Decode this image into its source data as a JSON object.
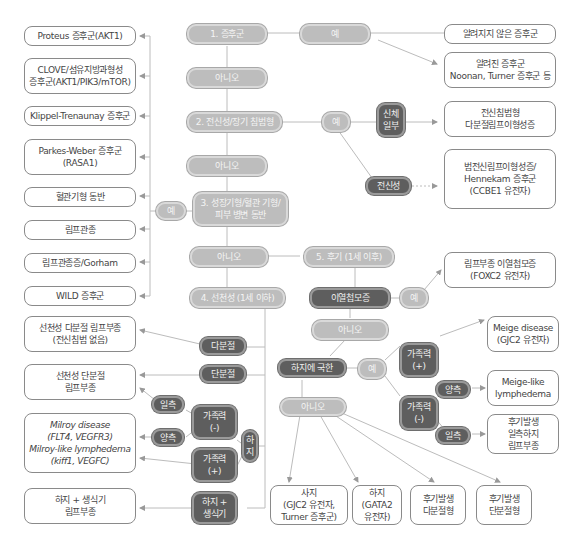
{
  "diagram": {
    "type": "flowchart",
    "colors": {
      "question": "#bdbdbd",
      "decision_dark": "#5e5e5e",
      "outcome_border": "#8a8a8a",
      "line": "#b5b5b5"
    },
    "main_steps": {
      "s1": "1. 증후군",
      "s1_yes": "예",
      "s1_no": "아니오",
      "s2": "2. 전신성/장기 침범형",
      "s2_yes": "예",
      "s2_no": "아니오",
      "s3": "3. 성장기형/혈관 기형/\n피부 병변 동반",
      "s3_yes": "예",
      "s3_no": "아니오",
      "s4": "4. 선천성 (1세 이하)",
      "s5": "5. 후기 (1세 이후)"
    },
    "step1_outcomes": [
      "알려지지 않은 증후군",
      "알려진 증후군\nNoonan, Turner 증후군 등"
    ],
    "step2_branches": {
      "partial": "신체\n일부",
      "partial_outcome": "전신침범형\n다분절림프이형성증",
      "systemic": "전신성",
      "systemic_outcome": "범전신림프이형성증/\nHennekam 증후군\n(CCBE1 유전자)"
    },
    "step3_outcomes": [
      "Proteus 증후군(AKT1)",
      "CLOVE/섬유지방과형성\n증후군(AKT1/PIK3/mTOR)",
      "Klippel-Trenaunay 증후군",
      "Parkes-Weber 증후군\n(RASA1)",
      "혈관기형 동반",
      "림프관종",
      "림프관종증/Gorham",
      "WILD 증후군"
    ],
    "step4": {
      "multi": "다분절",
      "multi_outcome": "선천성 다분절 림프부종\n(전신침범 없음)",
      "single": "단분절",
      "single_outcome": "선천성 단분절\n림프부종",
      "leg": "하\n지",
      "family_neg": "가족력\n(-)",
      "family_pos": "가족력\n(+)",
      "unilateral": "일측",
      "bilateral": "양측",
      "milroy_outcome": "Milroy disease\n(FLT4, VEGFR3)\nMilroy-like lymphedema\n(kiff1, VEGFC)",
      "leg_genital": "하지 +\n생식기",
      "leg_genital_outcome": "하지 + 생식기\n림프부종"
    },
    "step5": {
      "distichiasis": "이열첩모증",
      "distichiasis_yes": "예",
      "distichiasis_outcome": "림프부종 이열첩모증\n(FOXC2 유전자)",
      "distichiasis_no": "아니오",
      "leg_only": "하지에 국한",
      "leg_only_yes": "예",
      "family_pos": "가족력\n(+)",
      "family_pos_outcome": "Meige disease\n(GJC2 유전자)",
      "family_neg": "가족력\n(-)",
      "bilateral": "양측",
      "bilateral_outcome": "Meige-like\nlymphedema",
      "unilateral": "일측",
      "unilateral_outcome": "후기발생\n일측하지\n림프부종",
      "leg_only_no": "아니오",
      "final_outcomes": [
        "사지\n(GJC2 유전자,\nTurner 증후군)",
        "하지\n(GATA2\n유전자)",
        "후기발생\n다분절형",
        "후기발생\n단분절형"
      ]
    }
  }
}
